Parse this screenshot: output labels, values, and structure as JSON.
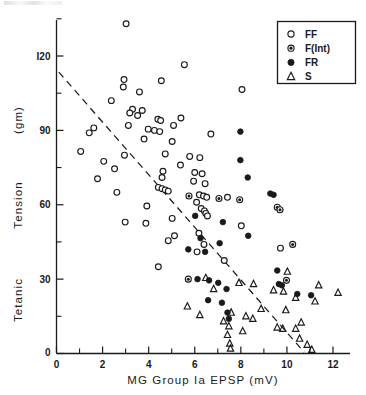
{
  "chart_data": {
    "type": "scatter",
    "title": "",
    "xlabel": "MG  Group  Ia  EPSP   (mV)",
    "ylabel_lines": [
      "Tetanic",
      "Tension",
      "(gm)"
    ],
    "ylabel": "Tetanic Tension (gm)",
    "xlim": [
      0,
      12.6
    ],
    "ylim": [
      0,
      138
    ],
    "xticks": [
      0,
      2,
      4,
      6,
      8,
      10,
      12
    ],
    "xtick_labels": [
      "0",
      "2",
      "4",
      "6",
      "8",
      "10",
      "12"
    ],
    "x_minor_step": 1,
    "yticks": [
      0,
      30,
      60,
      90,
      120
    ],
    "ytick_labels": [
      "0",
      "30",
      "60",
      "90",
      "I20"
    ],
    "y_minor_step": 15,
    "grid": false,
    "legend_position": "top-right",
    "trendline": {
      "style": "dashed",
      "x_start": 0.1,
      "y_start": 113.5,
      "x_end": 10.75,
      "y_end": 0.5
    },
    "series": [
      {
        "name": "FF",
        "marker": "open-circle",
        "points": [
          [
            3.02,
            133.0
          ],
          [
            5.55,
            116.5
          ],
          [
            2.93,
            110.5
          ],
          [
            4.55,
            110.0
          ],
          [
            2.9,
            107.5
          ],
          [
            8.05,
            106.5
          ],
          [
            3.6,
            105.5
          ],
          [
            2.38,
            102.0
          ],
          [
            3.3,
            98.5
          ],
          [
            3.72,
            98.0
          ],
          [
            3.18,
            97.0
          ],
          [
            3.52,
            96.0
          ],
          [
            5.4,
            95.0
          ],
          [
            4.4,
            94.5
          ],
          [
            4.52,
            94.0
          ],
          [
            3.12,
            92.0
          ],
          [
            5.08,
            92.0
          ],
          [
            1.62,
            91.0
          ],
          [
            3.98,
            90.5
          ],
          [
            4.25,
            90.0
          ],
          [
            4.48,
            89.5
          ],
          [
            1.42,
            89.0
          ],
          [
            6.7,
            88.5
          ],
          [
            3.8,
            86.5
          ],
          [
            5.02,
            85.5
          ],
          [
            1.05,
            81.5
          ],
          [
            4.72,
            80.5
          ],
          [
            2.95,
            80.0
          ],
          [
            5.78,
            79.5
          ],
          [
            6.22,
            79.0
          ],
          [
            2.05,
            77.5
          ],
          [
            5.38,
            76.0
          ],
          [
            2.52,
            74.5
          ],
          [
            4.62,
            73.5
          ],
          [
            6.0,
            73.0
          ],
          [
            6.32,
            72.5
          ],
          [
            4.58,
            71.0
          ],
          [
            1.78,
            70.5
          ],
          [
            5.95,
            69.5
          ],
          [
            6.45,
            68.5
          ],
          [
            4.42,
            67.0
          ],
          [
            4.58,
            66.5
          ],
          [
            4.72,
            66.0
          ],
          [
            4.85,
            65.5
          ],
          [
            2.62,
            65.0
          ],
          [
            6.2,
            64.0
          ],
          [
            6.38,
            63.5
          ],
          [
            6.52,
            63.0
          ],
          [
            7.42,
            63.0
          ],
          [
            6.08,
            61.0
          ],
          [
            3.92,
            59.5
          ],
          [
            6.28,
            58.5
          ],
          [
            6.42,
            57.5
          ],
          [
            6.48,
            56.5
          ],
          [
            6.55,
            55.5
          ],
          [
            5.02,
            54.5
          ],
          [
            2.98,
            53.0
          ],
          [
            3.88,
            52.5
          ],
          [
            8.02,
            51.5
          ],
          [
            6.18,
            48.5
          ],
          [
            5.12,
            47.5
          ],
          [
            4.85,
            45.5
          ],
          [
            6.4,
            44.0
          ],
          [
            9.72,
            42.5
          ],
          [
            6.1,
            41.0
          ],
          [
            7.28,
            37.5
          ],
          [
            4.42,
            35.0
          ]
        ]
      },
      {
        "name": "F(Int)",
        "marker": "dot-circle",
        "points": [
          [
            5.75,
            63.5
          ],
          [
            7.05,
            62.5
          ],
          [
            7.95,
            62.0
          ],
          [
            9.58,
            59.0
          ],
          [
            9.7,
            58.0
          ],
          [
            10.25,
            44.0
          ],
          [
            5.72,
            30.0
          ],
          [
            9.98,
            29.5
          ]
        ]
      },
      {
        "name": "FR",
        "marker": "filled-circle",
        "points": [
          [
            7.98,
            89.5
          ],
          [
            7.98,
            78.0
          ],
          [
            8.3,
            71.0
          ],
          [
            9.28,
            64.5
          ],
          [
            9.42,
            64.0
          ],
          [
            6.02,
            55.5
          ],
          [
            7.22,
            53.0
          ],
          [
            8.32,
            47.5
          ],
          [
            6.25,
            46.5
          ],
          [
            7.08,
            44.5
          ],
          [
            5.72,
            42.0
          ],
          [
            6.45,
            41.0
          ],
          [
            9.58,
            33.5
          ],
          [
            6.12,
            30.0
          ],
          [
            6.62,
            29.5
          ],
          [
            7.02,
            28.5
          ],
          [
            9.65,
            28.0
          ],
          [
            9.78,
            27.5
          ],
          [
            7.38,
            26.0
          ],
          [
            10.45,
            24.0
          ],
          [
            11.05,
            23.5
          ],
          [
            6.58,
            21.5
          ],
          [
            7.18,
            20.5
          ],
          [
            7.42,
            16.5
          ],
          [
            7.48,
            14.0
          ]
        ]
      },
      {
        "name": "S",
        "marker": "triangle",
        "points": [
          [
            10.02,
            33.0
          ],
          [
            6.48,
            30.5
          ],
          [
            7.92,
            28.5
          ],
          [
            8.55,
            28.0
          ],
          [
            11.38,
            27.5
          ],
          [
            6.82,
            26.0
          ],
          [
            9.42,
            25.5
          ],
          [
            9.85,
            25.0
          ],
          [
            12.22,
            24.5
          ],
          [
            10.38,
            22.5
          ],
          [
            11.22,
            21.0
          ],
          [
            5.68,
            19.0
          ],
          [
            8.88,
            18.0
          ],
          [
            9.95,
            17.5
          ],
          [
            7.58,
            16.5
          ],
          [
            6.22,
            15.5
          ],
          [
            8.22,
            15.0
          ],
          [
            8.52,
            14.0
          ],
          [
            7.25,
            13.0
          ],
          [
            10.62,
            12.5
          ],
          [
            7.48,
            11.0
          ],
          [
            9.58,
            10.5
          ],
          [
            9.82,
            10.0
          ],
          [
            10.38,
            10.0
          ],
          [
            8.08,
            9.0
          ],
          [
            7.42,
            7.5
          ],
          [
            10.55,
            6.0
          ],
          [
            7.52,
            4.0
          ],
          [
            10.88,
            3.5
          ],
          [
            7.55,
            2.0
          ],
          [
            11.08,
            1.5
          ]
        ]
      }
    ]
  },
  "legend": {
    "entries": [
      {
        "label": "FF",
        "marker": "open-circle"
      },
      {
        "label": "F(Int)",
        "marker": "dot-circle"
      },
      {
        "label": "FR",
        "marker": "filled-circle"
      },
      {
        "label": "S",
        "marker": "triangle"
      }
    ]
  },
  "colors": {
    "ink": "#1a1a1a",
    "background": "#ffffff"
  }
}
